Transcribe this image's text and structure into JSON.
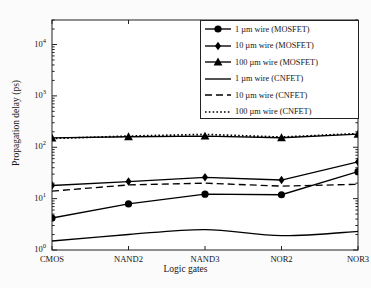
{
  "chart_data": {
    "type": "line",
    "title": "",
    "xlabel": "Logic gates",
    "ylabel": "Propagation delay (ps)",
    "categories": [
      "CMOS",
      "NAND2",
      "NAND3",
      "NOR2",
      "NOR3"
    ],
    "yscale": "log",
    "ylim": [
      1,
      30000
    ],
    "ytick_labels": [
      "10<sup>0</sup>",
      "10<sup>1</sup>",
      "10<sup>2</sup>",
      "10<sup>3</sup>",
      "10<sup>4</sup>"
    ],
    "ytick_values": [
      1,
      10,
      100,
      1000,
      10000
    ],
    "grid": false,
    "legend_position": "top-right",
    "series": [
      {
        "name": "1 µm wire (MOSFET)",
        "marker": "circle",
        "linestyle": "solid",
        "color": "#000000",
        "values": [
          4.2,
          7.9,
          12.2,
          11.9,
          33.5
        ]
      },
      {
        "name": "10 µm wire (MOSFET)",
        "marker": "diamond",
        "linestyle": "solid",
        "color": "#000000",
        "values": [
          18.0,
          21.5,
          26.0,
          23.0,
          52.0
        ]
      },
      {
        "name": "100 µm wire (MOSFET)",
        "marker": "triangle",
        "linestyle": "solid",
        "color": "#000000",
        "values": [
          152,
          160,
          165,
          153,
          180
        ]
      },
      {
        "name": "1 µm wire (CNFET)",
        "marker": "none",
        "linestyle": "solid",
        "color": "#000000",
        "values": [
          1.5,
          2.0,
          2.5,
          1.9,
          2.3
        ]
      },
      {
        "name": "10 µm wire (CNFET)",
        "marker": "none",
        "linestyle": "dashed",
        "color": "#000000",
        "values": [
          14.0,
          18.5,
          20.0,
          17.5,
          19.0
        ]
      },
      {
        "name": "100 µm wire (CNFET)",
        "marker": "none",
        "linestyle": "dotted",
        "color": "#000000",
        "values": [
          148,
          165,
          178,
          158,
          185
        ]
      }
    ]
  },
  "legend": {
    "items": [
      "1 µm wire (MOSFET)",
      "10 µm wire (MOSFET)",
      "100 µm wire (MOSFET)",
      "1 µm wire (CNFET)",
      "10 µm wire (CNFET)",
      "100 µm wire (CNFET)"
    ]
  }
}
